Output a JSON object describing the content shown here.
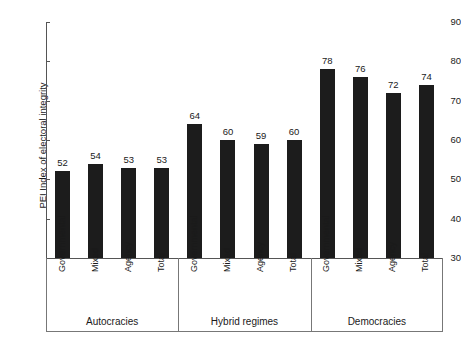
{
  "chart_data": {
    "type": "bar",
    "title": "",
    "xlabel": "",
    "ylabel": "PEI Index of electoral integrity",
    "ylim": [
      30,
      90
    ],
    "yticks": [
      30,
      40,
      50,
      60,
      70,
      80,
      90
    ],
    "grid": false,
    "legend": "none",
    "categories": [
      "Governmental",
      "Mixed",
      "Agency",
      "Total"
    ],
    "groups": [
      {
        "name": "Autocracies",
        "values": [
          52,
          54,
          53,
          53
        ]
      },
      {
        "name": "Hybrid regimes",
        "values": [
          64,
          60,
          59,
          60
        ]
      },
      {
        "name": "Democracies",
        "values": [
          78,
          76,
          72,
          74
        ]
      }
    ],
    "bars": [
      {
        "group": "Autocracies",
        "category": "Governmental",
        "value": 52
      },
      {
        "group": "Autocracies",
        "category": "Mixed",
        "value": 54
      },
      {
        "group": "Autocracies",
        "category": "Agency",
        "value": 53
      },
      {
        "group": "Autocracies",
        "category": "Total",
        "value": 53
      },
      {
        "group": "Hybrid regimes",
        "category": "Governmental",
        "value": 64
      },
      {
        "group": "Hybrid regimes",
        "category": "Mixed",
        "value": 60
      },
      {
        "group": "Hybrid regimes",
        "category": "Agency",
        "value": 59
      },
      {
        "group": "Hybrid regimes",
        "category": "Total",
        "value": 60
      },
      {
        "group": "Democracies",
        "category": "Governmental",
        "value": 78
      },
      {
        "group": "Democracies",
        "category": "Mixed",
        "value": 76
      },
      {
        "group": "Democracies",
        "category": "Agency",
        "value": 72
      },
      {
        "group": "Democracies",
        "category": "Total",
        "value": 74
      }
    ],
    "colors": {
      "bar": "#1c1c1c",
      "axis": "#555555",
      "separator": "#777777",
      "text": "#1a1a1a",
      "background": "#ffffff"
    }
  }
}
